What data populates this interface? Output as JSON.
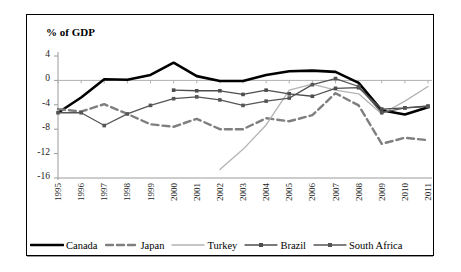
{
  "axis_title": "% of GDP",
  "chart_data": {
    "type": "line",
    "title": "% of GDP",
    "xlabel": "",
    "ylabel": "% of GDP",
    "ylim": [
      -16,
      4
    ],
    "yticks": [
      4,
      0,
      -4,
      -8,
      -12,
      -16
    ],
    "grid": false,
    "legend_position": "bottom",
    "categories": [
      "1995",
      "1996",
      "1997",
      "1998",
      "1999",
      "2000",
      "2001",
      "2002",
      "2003",
      "2004",
      "2005",
      "2006",
      "2007",
      "2008",
      "2009",
      "2010",
      "2011"
    ],
    "series": [
      {
        "name": "Canada",
        "color": "#000000",
        "style": "solid-thick",
        "marker": "none",
        "values": [
          -5.3,
          -2.8,
          0.2,
          0.1,
          0.9,
          2.9,
          0.7,
          -0.1,
          -0.1,
          0.9,
          1.5,
          1.6,
          1.4,
          -0.4,
          -4.9,
          -5.6,
          -4.4
        ]
      },
      {
        "name": "Japan",
        "color": "#7f7f7f",
        "style": "dashed",
        "marker": "none",
        "values": [
          -4.7,
          -5.1,
          -3.9,
          -5.5,
          -7.2,
          -7.6,
          -6.3,
          -8.0,
          -8.0,
          -6.2,
          -6.7,
          -5.7,
          -2.1,
          -4.1,
          -10.4,
          -9.4,
          -9.8
        ]
      },
      {
        "name": "Turkey",
        "color": "#b3b3b3",
        "style": "solid-thin",
        "marker": "none",
        "values": [
          null,
          null,
          null,
          null,
          null,
          null,
          null,
          -14.6,
          -11.3,
          -7.3,
          -1.6,
          -0.6,
          -1.6,
          -2.2,
          -5.5,
          -3.4,
          -1.0
        ]
      },
      {
        "name": "Brazil",
        "color": "#4d4d4d",
        "style": "solid-marker",
        "marker": "square",
        "values": [
          null,
          null,
          null,
          null,
          null,
          -1.6,
          -1.7,
          -1.7,
          -2.3,
          -1.6,
          -2.2,
          -2.6,
          -1.3,
          -1.2,
          -4.7,
          -4.5,
          -4.2
        ]
      },
      {
        "name": "South Africa",
        "color": "#555555",
        "style": "solid-marker",
        "marker": "square",
        "values": [
          -5.3,
          -5.3,
          -7.4,
          -5.5,
          -4.1,
          -3.0,
          -2.7,
          -3.2,
          -4.1,
          -3.4,
          -2.9,
          -0.7,
          0.3,
          -1.0,
          -5.3,
          -4.5,
          -4.3
        ]
      }
    ]
  },
  "legend": {
    "items": [
      {
        "label": "Canada"
      },
      {
        "label": "Japan"
      },
      {
        "label": "Turkey"
      },
      {
        "label": "Brazil"
      },
      {
        "label": "South Africa"
      }
    ]
  }
}
